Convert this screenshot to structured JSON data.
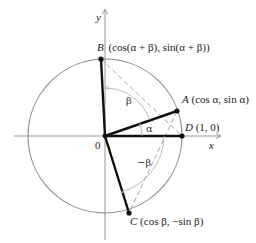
{
  "figure": {
    "axes": {
      "x_label": "x",
      "y_label": "y",
      "origin_label": "0"
    },
    "points": {
      "A": {
        "name": "A",
        "coords": "(cos α, sin α)"
      },
      "B": {
        "name": "B",
        "coords": "(cos(α + β), sin(α + β))"
      },
      "C": {
        "name": "C",
        "coords": "(cos β, −sin β)"
      },
      "D": {
        "name": "D",
        "coords": "(1, 0)"
      }
    },
    "angles": {
      "alpha": "α",
      "beta": "β",
      "neg_beta": "−β"
    },
    "colors": {
      "circle": "#8a8a8a",
      "segments": "#111111",
      "dashed": "#9a9a9a",
      "axes": "#8a8a8a"
    }
  }
}
